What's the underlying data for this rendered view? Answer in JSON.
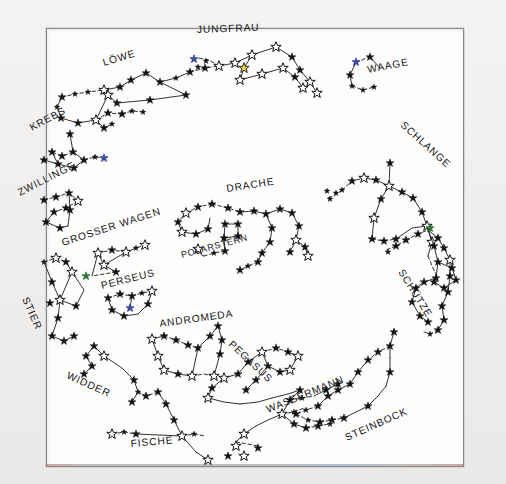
{
  "document": {
    "title": "Sternkarte",
    "kind": "hand-drawn star chart",
    "language": "German",
    "frame": {
      "border_color": "#8a8a8a",
      "paper_color": "#fdfdfc",
      "background_color": "#f1f0ee"
    }
  },
  "colors": {
    "ink": "#141414",
    "star_blue": "#3b4fa8",
    "star_green": "#2f7a3c",
    "star_yellow": "#e8d24a",
    "paper": "#fdfdfc"
  },
  "labels": {
    "loewe": "LÖWE",
    "jungfrau": "JUNGFRAU",
    "waage": "WAAGE",
    "krebs": "KREBS",
    "schlange": "SCHLANGE",
    "zwillinge": "ZWILLINGE",
    "drache": "DRACHE",
    "grosser_wagen": "GROSSER WAGEN",
    "polarstern": "POLARSTERN",
    "perseus": "PERSEUS",
    "stier": "STIER",
    "schuetze": "SCHÜTZE",
    "andromeda": "ANDROMEDA",
    "pegasus": "PEGASUS",
    "widder": "WIDDER",
    "wassermann": "WASSERMANN",
    "fische": "FISCHE",
    "steinbock": "STEINBOCK"
  },
  "constellations": [
    {
      "name": "LÖWE",
      "label_x": 104,
      "label_y": 66,
      "rotation": -17,
      "star_count": 22,
      "ring_position": "top-left"
    },
    {
      "name": "JUNGFRAU",
      "label_x": 197,
      "label_y": 33,
      "rotation": -2,
      "star_count": 13,
      "ring_position": "top-center",
      "special_stars": [
        "blue",
        "yellow"
      ]
    },
    {
      "name": "WAAGE",
      "label_x": 368,
      "label_y": 73,
      "rotation": -11,
      "star_count": 6,
      "ring_position": "top-right",
      "special_stars": [
        "blue"
      ]
    },
    {
      "name": "KREBS",
      "label_x": 32,
      "label_y": 131,
      "rotation": -28,
      "star_count": 8,
      "ring_position": "left-upper",
      "special_stars": [
        "blue"
      ]
    },
    {
      "name": "SCHLANGE",
      "label_x": 400,
      "label_y": 126,
      "rotation": 42,
      "star_count": 18,
      "ring_position": "right-upper"
    },
    {
      "name": "ZWILLINGE",
      "label_x": 20,
      "label_y": 196,
      "rotation": -27,
      "star_count": 9,
      "ring_position": "left"
    },
    {
      "name": "DRACHE",
      "label_x": 227,
      "label_y": 192,
      "rotation": -9,
      "star_count": 26,
      "ring_position": "center"
    },
    {
      "name": "GROSSER WAGEN",
      "label_x": 63,
      "label_y": 246,
      "rotation": -18,
      "star_count": 7,
      "ring_position": "center-left",
      "special_stars": [
        "green"
      ]
    },
    {
      "name": "POLARSTERN",
      "label_x": 182,
      "label_y": 258,
      "rotation": -15,
      "star_count": 1,
      "ring_position": "center"
    },
    {
      "name": "PERSEUS",
      "label_x": 102,
      "label_y": 289,
      "rotation": -14,
      "star_count": 9,
      "ring_position": "center-left",
      "special_stars": [
        "blue"
      ]
    },
    {
      "name": "STIER",
      "label_x": 22,
      "label_y": 299,
      "rotation": 66,
      "star_count": 12,
      "ring_position": "left-lower"
    },
    {
      "name": "SCHÜTZE",
      "label_x": 398,
      "label_y": 272,
      "rotation": 58,
      "star_count": 23,
      "ring_position": "right-lower",
      "special_stars": [
        "green"
      ]
    },
    {
      "name": "ANDROMEDA",
      "label_x": 160,
      "label_y": 327,
      "rotation": -8,
      "star_count": 13,
      "ring_position": "bottom-center-left"
    },
    {
      "name": "PEGASUS",
      "label_x": 228,
      "label_y": 345,
      "rotation": 43,
      "star_count": 14,
      "ring_position": "bottom-center"
    },
    {
      "name": "WIDDER",
      "label_x": 66,
      "label_y": 378,
      "rotation": 24,
      "star_count": 8,
      "ring_position": "bottom-left"
    },
    {
      "name": "WASSERMANN",
      "label_x": 268,
      "label_y": 413,
      "rotation": -22,
      "star_count": 16,
      "ring_position": "bottom-right"
    },
    {
      "name": "FISCHE",
      "label_x": 131,
      "label_y": 447,
      "rotation": -5,
      "star_count": 12,
      "ring_position": "bottom"
    },
    {
      "name": "STEINBOCK",
      "label_x": 347,
      "label_y": 441,
      "rotation": -24,
      "star_count": 17,
      "ring_position": "bottom-right"
    }
  ]
}
